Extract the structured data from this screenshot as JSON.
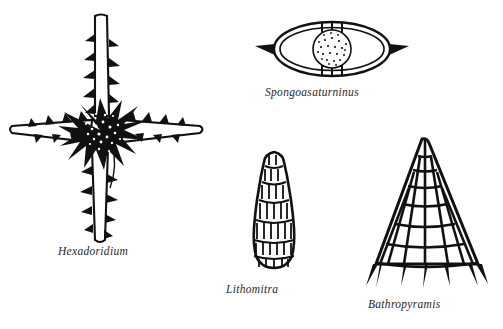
{
  "plate": {
    "kind": "scientific-illustration-plate",
    "subject": "radiolarian microfossil genera",
    "background_color": "#ffffff",
    "ink_color": "#121010",
    "label_color": "#2b2722",
    "figure_count": 4
  },
  "figures": [
    {
      "id": "hexadoridium",
      "label": "Hexadoridium",
      "position": "left",
      "form": "cross-shaped spicule with four barbed spines and spiny central mass"
    },
    {
      "id": "spongoasaturninus",
      "label": "Spongoasaturninus",
      "position": "top-right",
      "form": "elliptical double ring with lateral spines and stippled central body"
    },
    {
      "id": "lithomitra",
      "label": "Lithomitra",
      "position": "bottom-center",
      "form": "segmented conical shell with banded chambers"
    },
    {
      "id": "bathropyramis",
      "label": "Bathropyramis",
      "position": "bottom-right",
      "form": "tall latticed pyramid with rectangular pores and basal leg spines"
    }
  ]
}
